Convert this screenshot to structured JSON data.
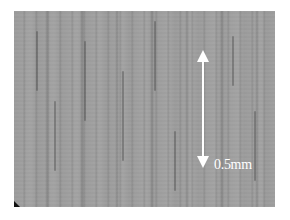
{
  "image": {
    "description": "Grayscale optical micrograph of a surface with vertical streak texture",
    "background_color": "#9c9c9c"
  },
  "scale_bar": {
    "label": "0.5mm",
    "color": "#ffffff",
    "orientation": "vertical",
    "arrows": [
      "arrow-up-icon",
      "arrow-down-icon"
    ]
  }
}
